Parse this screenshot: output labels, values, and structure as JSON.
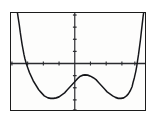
{
  "app": {
    "name": "graphing-calculator-screen",
    "title": "Graphing calculator display"
  },
  "screen": {
    "background_color": "#fdfdfc",
    "border_color": "#1c1c1c",
    "curve_color": "#15161a",
    "axis_color": "#2a2b2f",
    "frame": {
      "x": 10,
      "y": 12,
      "width": 136,
      "height": 99
    }
  },
  "chart_data": {
    "type": "line",
    "title": "",
    "subtitle": "",
    "xlabel": "",
    "ylabel": "",
    "grid": false,
    "legend": null,
    "axes": {
      "x_axis_pixel_y": 50,
      "y_axis_pixel_x": 69,
      "x_tick_spacing_px": 17,
      "y_tick_spacing_px": 12,
      "x_tick_length_px": 4,
      "y_tick_length_px": 4,
      "x_ticks_px": [
        1,
        18,
        35,
        52,
        69,
        86,
        103,
        120,
        134
      ],
      "y_ticks_px": [
        2,
        14,
        26,
        38,
        50,
        62,
        74,
        86,
        96
      ]
    },
    "xlim": [
      -4.1,
      3.9
    ],
    "ylim": [
      -4.2,
      4.2
    ],
    "features": {
      "x_intercepts": [
        -3.35,
        3.2
      ],
      "local_minima": [
        {
          "x": -2.1,
          "y": -2.4
        },
        {
          "x": 2.2,
          "y": -2.35
        }
      ],
      "local_maximum": {
        "x": 0.0,
        "y": -0.9
      }
    },
    "series": [
      {
        "name": "curve",
        "points_px": [
          [
            7,
            0
          ],
          [
            8,
            6
          ],
          [
            9,
            12
          ],
          [
            10,
            19
          ],
          [
            11,
            25
          ],
          [
            12,
            31
          ],
          [
            13,
            36
          ],
          [
            14,
            41
          ],
          [
            15,
            45
          ],
          [
            16.5,
            50
          ],
          [
            18,
            54
          ],
          [
            20,
            59
          ],
          [
            22,
            63
          ],
          [
            24,
            67
          ],
          [
            26,
            70
          ],
          [
            28,
            73
          ],
          [
            30,
            76
          ],
          [
            32,
            78
          ],
          [
            34,
            80
          ],
          [
            36,
            82
          ],
          [
            38,
            83
          ],
          [
            40,
            84
          ],
          [
            43,
            84.5
          ],
          [
            46,
            84.5
          ],
          [
            49,
            84
          ],
          [
            52,
            83
          ],
          [
            55,
            81
          ],
          [
            58,
            79
          ],
          [
            61,
            76
          ],
          [
            64,
            73
          ],
          [
            67,
            70
          ],
          [
            69,
            68
          ],
          [
            72,
            65
          ],
          [
            75,
            62.5
          ],
          [
            78,
            61.5
          ],
          [
            80,
            61.2
          ],
          [
            83,
            61.5
          ],
          [
            86,
            62.5
          ],
          [
            89,
            64
          ],
          [
            92,
            66
          ],
          [
            95,
            69
          ],
          [
            98,
            72
          ],
          [
            101,
            75
          ],
          [
            104,
            78
          ],
          [
            107,
            80
          ],
          [
            110,
            82
          ],
          [
            113,
            83.5
          ],
          [
            116,
            84.5
          ],
          [
            119,
            84.5
          ],
          [
            122,
            84
          ],
          [
            125,
            82
          ],
          [
            127,
            80
          ],
          [
            129,
            77
          ],
          [
            131,
            73
          ],
          [
            132,
            69
          ],
          [
            133.5,
            64
          ],
          [
            135,
            58
          ],
          [
            136,
            53
          ],
          [
            137,
            47
          ],
          [
            138,
            41
          ],
          [
            139,
            34
          ],
          [
            140,
            27
          ],
          [
            141,
            19
          ],
          [
            142,
            11
          ],
          [
            143,
            3
          ],
          [
            143.5,
            0
          ]
        ]
      }
    ]
  }
}
